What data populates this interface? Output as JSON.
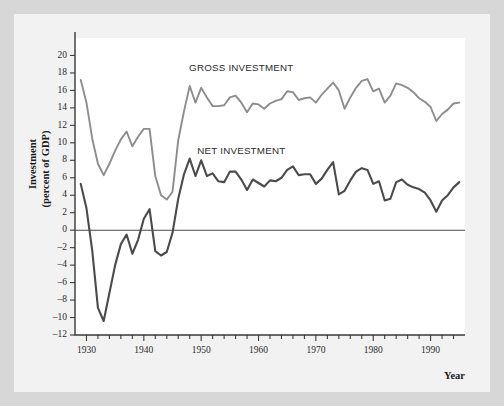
{
  "figure": {
    "background": "#f2f2f2",
    "outer_background": "#d7d7d7",
    "plot_background": "#ffffff"
  },
  "labels": {
    "y_axis_title_line1": "Investment",
    "y_axis_title_line2": "(percent of GDP)",
    "x_axis_title": "Year",
    "gross_label": "GROSS INVESTMENT",
    "net_label": "NET INVESTMENT"
  },
  "chart_data": {
    "type": "line",
    "title": "",
    "xlabel": "Year",
    "ylabel": "Investment (percent of GDP)",
    "xlim": [
      1928,
      1996
    ],
    "ylim": [
      -12,
      22
    ],
    "ytick_step": 2,
    "yticks": [
      -12,
      -10,
      -8,
      -6,
      -4,
      -2,
      0,
      2,
      4,
      6,
      8,
      10,
      12,
      14,
      16,
      18,
      20
    ],
    "ytick_labels": [
      "-12",
      "-10",
      "-8",
      "-6",
      "-4",
      "-2",
      "0",
      "2",
      "4",
      "6",
      "8",
      "10",
      "12",
      "14",
      "16",
      "18",
      "20"
    ],
    "xticks": [
      1930,
      1940,
      1950,
      1960,
      1970,
      1980,
      1990
    ],
    "xtick_labels": [
      "1930",
      "1940",
      "1950",
      "1960",
      "1970",
      "1980",
      "1990"
    ],
    "xtick_minor_step": 2,
    "grid": false,
    "zero_line": 0,
    "legend_position": "inline-annotation",
    "series": [
      {
        "name": "GROSS INVESTMENT",
        "color": "#8d8d8d",
        "width": 1.9,
        "x": [
          1929,
          1930,
          1931,
          1932,
          1933,
          1934,
          1935,
          1936,
          1937,
          1938,
          1939,
          1940,
          1941,
          1942,
          1943,
          1944,
          1945,
          1946,
          1947,
          1948,
          1949,
          1950,
          1951,
          1952,
          1953,
          1954,
          1955,
          1956,
          1957,
          1958,
          1959,
          1960,
          1961,
          1962,
          1963,
          1964,
          1965,
          1966,
          1967,
          1968,
          1969,
          1970,
          1971,
          1972,
          1973,
          1974,
          1975,
          1976,
          1977,
          1978,
          1979,
          1980,
          1981,
          1982,
          1983,
          1984,
          1985,
          1986,
          1987,
          1988,
          1989,
          1990,
          1991,
          1992,
          1993,
          1994,
          1995
        ],
        "values": [
          17.2,
          14.6,
          10.5,
          7.6,
          6.3,
          7.6,
          9.1,
          10.4,
          11.3,
          9.6,
          10.7,
          11.6,
          11.6,
          6.2,
          4.0,
          3.5,
          4.4,
          10.3,
          13.6,
          16.5,
          14.6,
          16.3,
          15.2,
          14.2,
          14.2,
          14.3,
          15.2,
          15.4,
          14.6,
          13.5,
          14.5,
          14.4,
          13.9,
          14.5,
          14.8,
          15.0,
          15.9,
          15.8,
          14.9,
          15.1,
          15.2,
          14.6,
          15.5,
          16.2,
          16.9,
          16.0,
          13.9,
          15.2,
          16.3,
          17.1,
          17.3,
          15.9,
          16.2,
          14.6,
          15.4,
          16.8,
          16.6,
          16.3,
          15.8,
          15.1,
          14.7,
          14.1,
          12.5,
          13.3,
          13.8,
          14.5,
          14.6
        ]
      },
      {
        "name": "NET INVESTMENT",
        "color": "#4b4b4b",
        "width": 2.1,
        "x": [
          1929,
          1930,
          1931,
          1932,
          1933,
          1934,
          1935,
          1936,
          1937,
          1938,
          1939,
          1940,
          1941,
          1942,
          1943,
          1944,
          1945,
          1946,
          1947,
          1948,
          1949,
          1950,
          1951,
          1952,
          1953,
          1954,
          1955,
          1956,
          1957,
          1958,
          1959,
          1960,
          1961,
          1962,
          1963,
          1964,
          1965,
          1966,
          1967,
          1968,
          1969,
          1970,
          1971,
          1972,
          1973,
          1974,
          1975,
          1976,
          1977,
          1978,
          1979,
          1980,
          1981,
          1982,
          1983,
          1984,
          1985,
          1986,
          1987,
          1988,
          1989,
          1990,
          1991,
          1992,
          1993,
          1994,
          1995
        ],
        "values": [
          5.3,
          2.5,
          -2.3,
          -8.9,
          -10.4,
          -7.2,
          -4.0,
          -1.6,
          -0.5,
          -2.7,
          -1.1,
          1.3,
          2.4,
          -2.4,
          -2.9,
          -2.5,
          -0.3,
          3.6,
          6.4,
          8.2,
          6.2,
          8.0,
          6.2,
          6.5,
          5.6,
          5.5,
          6.7,
          6.7,
          5.8,
          4.6,
          5.8,
          5.4,
          5.0,
          5.7,
          5.6,
          6.0,
          6.9,
          7.3,
          6.3,
          6.4,
          6.4,
          5.3,
          5.9,
          6.9,
          7.8,
          4.1,
          4.5,
          5.7,
          6.7,
          7.1,
          6.9,
          5.3,
          5.6,
          3.4,
          3.6,
          5.5,
          5.8,
          5.2,
          4.9,
          4.7,
          4.3,
          3.4,
          2.1,
          3.4,
          4.0,
          4.9,
          5.5
        ]
      }
    ],
    "annotations": [
      {
        "text": "GROSS INVESTMENT",
        "x": 1957,
        "y": 18.2
      },
      {
        "text": "NET INVESTMENT",
        "x": 1957,
        "y": 8.7
      }
    ]
  }
}
